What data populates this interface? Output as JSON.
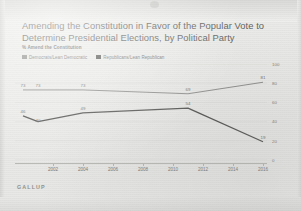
{
  "brand": "GALLUP",
  "header": {
    "title": "Amending the Constitution in Favor of the Popular Vote to Determine Presidential Elections, by Political Party",
    "subtitle": "% Amend the Constitution"
  },
  "colors": {
    "democrat": "#8c8c8a",
    "republican": "#4f4f4d",
    "axis": "#b6b6b3",
    "grid": "#dcdcda",
    "page_background": "#ececeb",
    "text": "#5d5d5b"
  },
  "chart_data": {
    "type": "line",
    "title": "Amending the Constitution in Favor of the Popular Vote to Determine Presidential Elections, by Political Party",
    "subtitle": "% Amend the Constitution",
    "xlabel": "",
    "ylabel": "% Amend the Constitution",
    "ylim": [
      0,
      100
    ],
    "yticks": [
      100,
      80,
      60,
      40,
      20,
      0
    ],
    "xticks": [
      2002,
      2004,
      2006,
      2008,
      2010,
      2012,
      2014,
      2016
    ],
    "grid": true,
    "legend_position": "top-left",
    "series": [
      {
        "name": "Democrats/Lean Democratic",
        "color": "#8c8c8a",
        "x": [
          2000,
          2001,
          2004,
          2011,
          2016
        ],
        "values": [
          73,
          73,
          73,
          69,
          81
        ],
        "labels": [
          "73",
          "73",
          "73",
          "69",
          "81"
        ]
      },
      {
        "name": "Republicans/Lean Republican",
        "color": "#4f4f4d",
        "x": [
          2000,
          2001,
          2004,
          2011,
          2016
        ],
        "values": [
          46,
          40,
          49,
          54,
          19
        ],
        "labels": [
          "46",
          "40",
          "49",
          "54",
          "19"
        ]
      }
    ]
  }
}
